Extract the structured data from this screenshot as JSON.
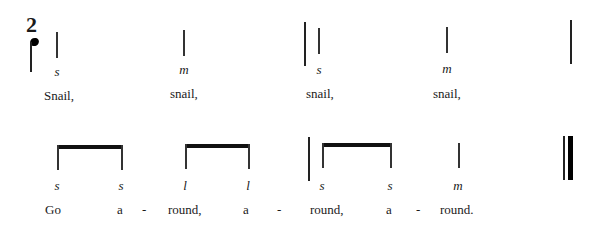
{
  "time_signature": {
    "top": "2",
    "bottom_symbol": "quarter-note"
  },
  "line1": {
    "notes": [
      {
        "x": 57,
        "syllable": "s",
        "lyric": "Snail,",
        "lyric_x": 44
      },
      {
        "x": 184,
        "syllable": "m",
        "lyric": "snail,",
        "lyric_x": 170
      },
      {
        "x": 319,
        "syllable": "s",
        "lyric": "snail,",
        "lyric_x": 306
      },
      {
        "x": 447,
        "syllable": "m",
        "lyric": "snail,",
        "lyric_x": 433
      }
    ]
  },
  "line2": {
    "syllables": [
      {
        "x": 57,
        "text": "s"
      },
      {
        "x": 121,
        "text": "s"
      },
      {
        "x": 185,
        "text": "l"
      },
      {
        "x": 248,
        "text": "l"
      },
      {
        "x": 322,
        "text": "s"
      },
      {
        "x": 390,
        "text": "s"
      },
      {
        "x": 458,
        "text": "m"
      }
    ],
    "lyrics": [
      {
        "x": 45,
        "text": "Go"
      },
      {
        "x": 117,
        "text": "a"
      },
      {
        "x": 142,
        "text": "-"
      },
      {
        "x": 168,
        "text": "round,"
      },
      {
        "x": 243,
        "text": "a"
      },
      {
        "x": 277,
        "text": "-"
      },
      {
        "x": 310,
        "text": "round,"
      },
      {
        "x": 386,
        "text": "a"
      },
      {
        "x": 416,
        "text": "-"
      },
      {
        "x": 440,
        "text": "round."
      }
    ]
  }
}
